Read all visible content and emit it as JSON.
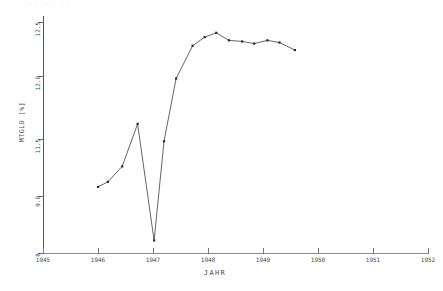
{
  "scan_artifact": "···  ····  ··",
  "axes": {
    "y_title": "MTGLD [%]",
    "x_title": "JAHR",
    "y_ticks": [
      {
        "label": "12.5",
        "value": 12.5
      },
      {
        "label": "12.0",
        "value": 12.0
      },
      {
        "label": "11.5",
        "value": 11.5
      },
      {
        "label": "9.0",
        "value": 9.0
      },
      {
        "label": "8",
        "value": 8.0
      }
    ],
    "x_ticks": [
      {
        "label": "1945",
        "value": 1945
      },
      {
        "label": "1946",
        "value": 1946
      },
      {
        "label": "1947",
        "value": 1947
      },
      {
        "label": "1948",
        "value": 1948
      },
      {
        "label": "1949",
        "value": 1949
      },
      {
        "label": "1950",
        "value": 1950
      },
      {
        "label": "1951",
        "value": 1951
      },
      {
        "label": "1952",
        "value": 1952
      }
    ]
  },
  "chart_data": {
    "type": "line",
    "title": "",
    "subtitle": "",
    "xlabel": "JAHR",
    "ylabel": "MTGLD [%]",
    "xlim": [
      1945.0,
      1952.0
    ],
    "ylim": [
      8.0,
      12.5
    ],
    "grid": false,
    "legend": null,
    "marker": "square",
    "line_color": "#3d3d3d",
    "marker_color": "#2b2b2b",
    "series": [
      {
        "name": "MTGLD",
        "x": [
          1946.0,
          1946.18,
          1946.44,
          1946.72,
          1947.02,
          1947.2,
          1947.42,
          1947.72,
          1947.94,
          1948.15,
          1948.38,
          1948.62,
          1948.84,
          1949.08,
          1949.3,
          1949.58
        ],
        "y": [
          9.4,
          9.62,
          10.3,
          11.62,
          8.22,
          11.4,
          11.98,
          12.28,
          12.36,
          12.4,
          12.33,
          12.32,
          12.3,
          12.33,
          12.31,
          12.24
        ]
      }
    ]
  }
}
